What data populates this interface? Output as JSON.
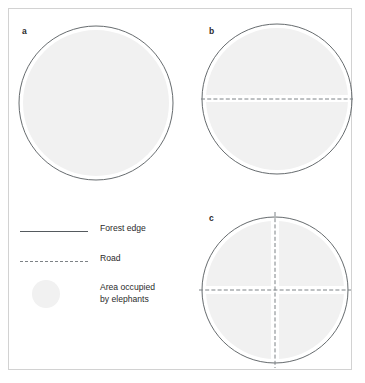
{
  "figure": {
    "background_color": "#ffffff",
    "frame_color": "#d2d2d2",
    "outline_color": "#555a5e",
    "road_color": "#7d8286",
    "fill_color": "#f1f1f1",
    "panels": [
      {
        "id": "a",
        "label": "a",
        "description": "Continuous forest with a single unbroken area occupied by elephants",
        "roads": 0,
        "fragments": 1
      },
      {
        "id": "b",
        "label": "b",
        "description": "Forest bisected by one road into two elephant areas",
        "roads": 1,
        "fragments": 2
      },
      {
        "id": "c",
        "label": "c",
        "description": "Forest crossed by two roads into four elephant areas",
        "roads": 2,
        "fragments": 4
      }
    ]
  },
  "legend": {
    "items": [
      {
        "key": "forest_edge",
        "symbol": "solid-line",
        "label": "Forest edge"
      },
      {
        "key": "road",
        "symbol": "dashed-line",
        "label": "Road"
      },
      {
        "key": "area_elephants",
        "symbol": "gray-circle",
        "label": "Area occupied\nby elephants"
      }
    ]
  }
}
